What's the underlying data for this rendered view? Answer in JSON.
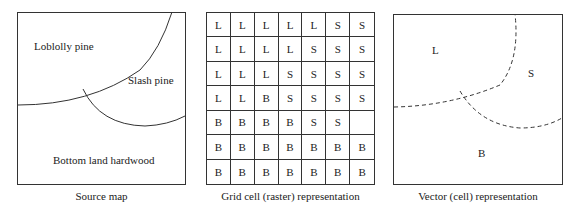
{
  "panels": {
    "source": {
      "caption": "Source map",
      "regions": {
        "loblolly": "Loblolly pine",
        "slash": "Slash pine",
        "bottom": "Bottom land hardwood"
      }
    },
    "raster": {
      "caption": "Grid cell (raster) representation",
      "rows": [
        [
          "L",
          "L",
          "L",
          "L",
          "L",
          "S",
          "S"
        ],
        [
          "L",
          "L",
          "L",
          "L",
          "S",
          "S",
          "S"
        ],
        [
          "L",
          "L",
          "L",
          "S",
          "S",
          "S",
          "S"
        ],
        [
          "L",
          "L",
          "B",
          "S",
          "S",
          "S",
          "S"
        ],
        [
          "B",
          "B",
          "B",
          "B",
          "S",
          "S",
          ""
        ],
        [
          "B",
          "B",
          "B",
          "B",
          "B",
          "B",
          "B"
        ],
        [
          "B",
          "B",
          "B",
          "B",
          "B",
          "B",
          "B"
        ]
      ]
    },
    "vector": {
      "caption": "Vector (cell) representation",
      "labels": {
        "l": "L",
        "s": "S",
        "b": "B"
      }
    }
  },
  "colors": {
    "line": "#333333",
    "text": "#222222",
    "background": "#ffffff"
  }
}
